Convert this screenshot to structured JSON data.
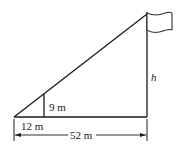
{
  "diagram": {
    "type": "similar-triangles flagpole",
    "labels": {
      "small_height": "9 m",
      "small_base": "12 m",
      "total_base": "52 m",
      "pole_height": "h"
    },
    "colors": {
      "stroke": "#1a1a1a",
      "background": "#ffffff"
    }
  }
}
